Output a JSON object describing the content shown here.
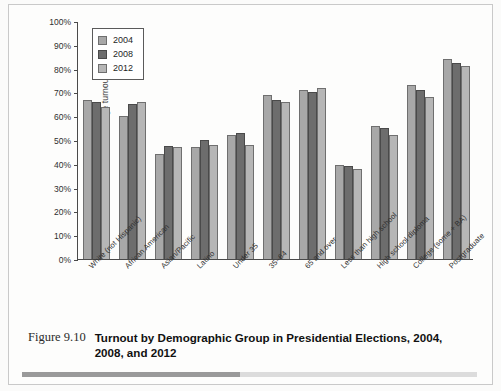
{
  "figure": {
    "number": "Figure 9.10",
    "title": "Turnout by Demographic Group in Presidential Elections, 2004, 2008, and 2012"
  },
  "chart_data": {
    "type": "bar",
    "title": "Turnout by Demographic Group in Presidential Elections, 2004, 2008, and 2012",
    "xlabel": "",
    "ylabel": "Percentage turnout",
    "ylim": [
      0,
      100
    ],
    "ytick_labels": [
      "100%",
      "90%",
      "80%",
      "70%",
      "60%",
      "50%",
      "40%",
      "30%",
      "20%",
      "10%",
      "0%"
    ],
    "ytick_values": [
      100,
      90,
      80,
      70,
      60,
      50,
      40,
      30,
      20,
      10,
      0
    ],
    "grid": false,
    "legend_position": "top-left",
    "categories": [
      "White (not Hispanic)",
      "African American",
      "Asian/Pacific",
      "Latino",
      "Under 35",
      "35–64",
      "65 and over",
      "Less than high school",
      "High school diploma",
      "College (some + BA)",
      "Postgraduate"
    ],
    "series": [
      {
        "name": "2004",
        "color": "#a8a8a8",
        "values": [
          67,
          60,
          44,
          47,
          52,
          69,
          71,
          39.5,
          56,
          73,
          84
        ]
      },
      {
        "name": "2008",
        "color": "#6d6d6d",
        "values": [
          66,
          65,
          47.5,
          50,
          53,
          67,
          70,
          39,
          55,
          71,
          82.5
        ]
      },
      {
        "name": "2012",
        "color": "#b6b6b6",
        "values": [
          64,
          66,
          47,
          48,
          48,
          66,
          72,
          38,
          52,
          68,
          81
        ]
      }
    ]
  }
}
